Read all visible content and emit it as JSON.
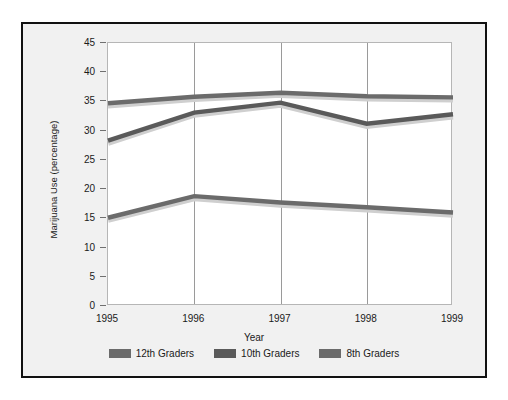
{
  "chart_data": {
    "type": "line",
    "title": "",
    "xlabel": "Year",
    "ylabel": "Marijuana Use (percentage)",
    "categories": [
      "1995",
      "1996",
      "1997",
      "1998",
      "1999"
    ],
    "x": [
      1995,
      1996,
      1997,
      1998,
      1999
    ],
    "xlim": [
      1995,
      1999
    ],
    "ylim": [
      0,
      45
    ],
    "yticks": [
      0,
      5,
      10,
      15,
      20,
      25,
      30,
      35,
      40,
      45
    ],
    "ytick_labels": [
      "0",
      "5",
      "10",
      "15",
      "20",
      "25",
      "30",
      "35",
      "40",
      "45"
    ],
    "grid": "vertical-only",
    "legend_position": "bottom-center",
    "series": [
      {
        "name": "12th Graders",
        "color": "#6b6b6b",
        "values": [
          34.7,
          35.8,
          36.5,
          35.9,
          35.7
        ]
      },
      {
        "name": "10th Graders",
        "color": "#5a5a5a",
        "values": [
          28.3,
          33.1,
          34.8,
          31.2,
          32.8
        ]
      },
      {
        "name": "8th Graders",
        "color": "#6b6b6b",
        "values": [
          15.1,
          18.8,
          17.7,
          16.9,
          16.0
        ]
      }
    ]
  },
  "axes": {
    "y_title": "Marijuana Use (percentage)",
    "x_title": "Year"
  },
  "legend": {
    "entries": [
      {
        "label": "12th Graders",
        "color": "#6b6b6b"
      },
      {
        "label": "10th Graders",
        "color": "#5a5a5a"
      },
      {
        "label": "8th Graders",
        "color": "#6b6b6b"
      }
    ]
  }
}
